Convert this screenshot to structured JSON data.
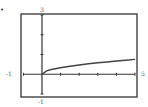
{
  "marker": "•",
  "chart_data": {
    "type": "line",
    "title": "",
    "xlabel": "",
    "ylabel": "",
    "xlim": [
      -1,
      5
    ],
    "ylim": [
      -1,
      3
    ],
    "xtick_step": 1,
    "ytick_step": 1,
    "grid": false,
    "legend": null,
    "axis_labels": {
      "xmin": "-1",
      "xmax": "5",
      "ymin": "-1",
      "ymax": "3"
    },
    "series": [
      {
        "name": "f(x)",
        "x": [
          0,
          0.25,
          0.5,
          1,
          1.5,
          2,
          2.5,
          3,
          3.5,
          4,
          4.5,
          5
        ],
        "y": [
          0,
          0.17,
          0.24,
          0.33,
          0.41,
          0.47,
          0.53,
          0.58,
          0.62,
          0.67,
          0.71,
          0.75
        ]
      }
    ]
  },
  "colors": {
    "frame": "#333333",
    "axis": "#333333",
    "curve": "#444444",
    "label": "#555555"
  }
}
